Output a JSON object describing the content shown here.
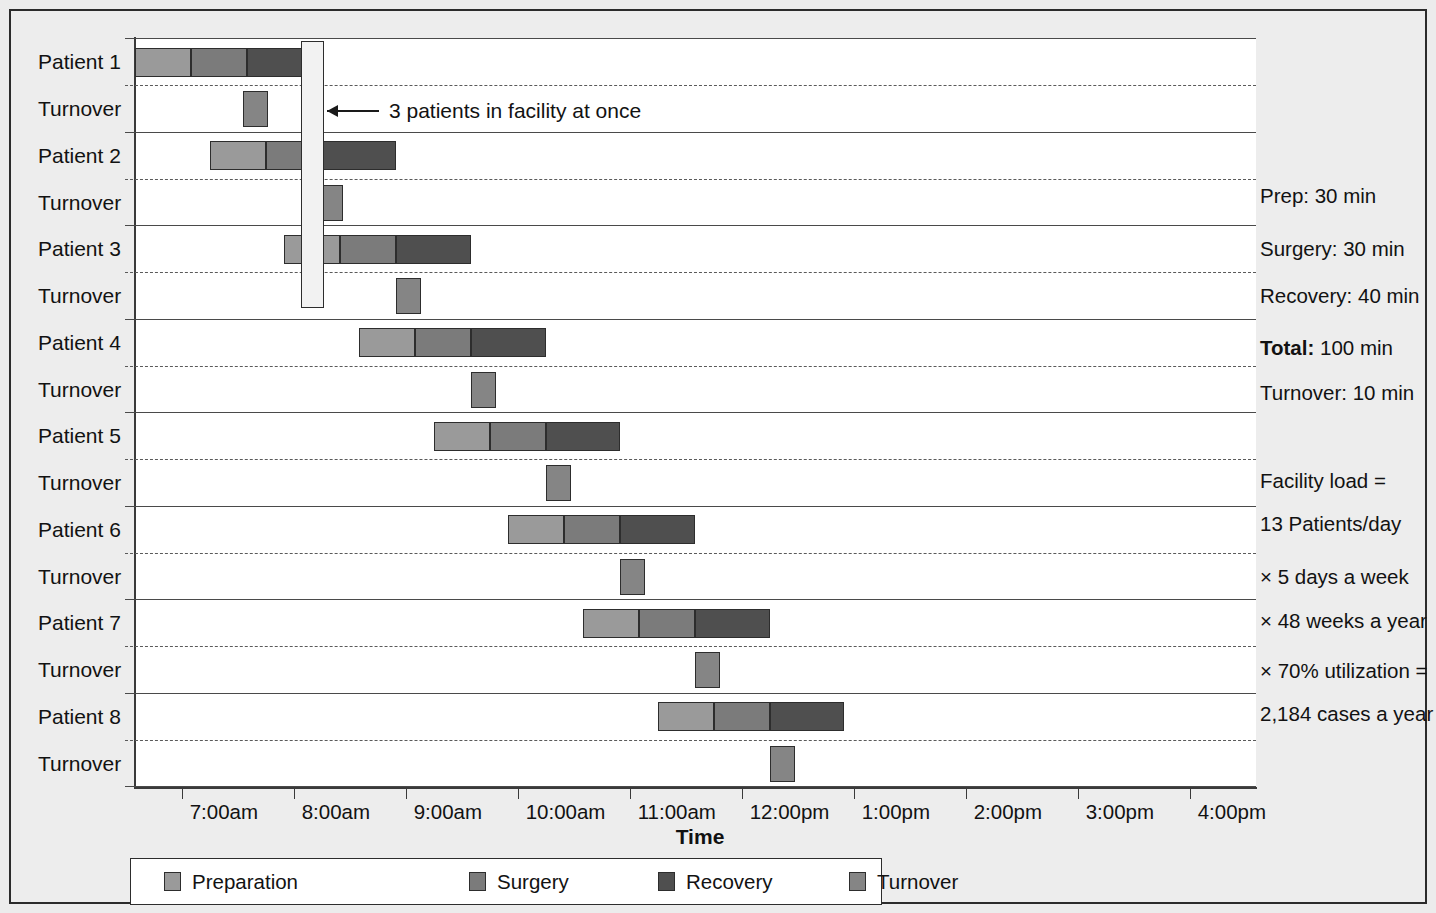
{
  "chart_data": {
    "type": "bar",
    "subtype": "gantt",
    "title": "",
    "xlabel": "Time",
    "ylabel": "",
    "grid": "horizontal row separators (solid between patient groups, dashed between patient and turnover)",
    "legend_position": "bottom",
    "x_axis": {
      "tick_labels": [
        "7:00am",
        "8:00am",
        "9:00am",
        "10:00am",
        "11:00am",
        "12:00pm",
        "1:00pm",
        "2:00pm",
        "3:00pm",
        "4:00pm"
      ],
      "range_start": "6:35am",
      "range_end": "4:35pm",
      "minutes_per_hour_px": 112
    },
    "rows": [
      "Patient 1",
      "Turnover",
      "Patient 2",
      "Turnover",
      "Patient 3",
      "Turnover",
      "Patient 4",
      "Turnover",
      "Patient 5",
      "Turnover",
      "Patient 6",
      "Turnover",
      "Patient 7",
      "Turnover",
      "Patient 8",
      "Turnover"
    ],
    "durations_min": {
      "preparation": 30,
      "surgery": 30,
      "recovery": 40,
      "turnover": 10
    },
    "patients": [
      {
        "name": "Patient 1",
        "start": "6:35am",
        "prep_start_min": 0,
        "segments": [
          {
            "phase": "Preparation",
            "minutes": 30
          },
          {
            "phase": "Surgery",
            "minutes": 30
          },
          {
            "phase": "Recovery",
            "minutes": 40
          }
        ],
        "turnover_start_min": 58
      },
      {
        "name": "Patient 2",
        "start": "7:15am",
        "prep_start_min": 40,
        "segments": [
          {
            "phase": "Preparation",
            "minutes": 30
          },
          {
            "phase": "Surgery",
            "minutes": 30
          },
          {
            "phase": "Recovery",
            "minutes": 40
          }
        ],
        "turnover_start_min": 98
      },
      {
        "name": "Patient 3",
        "start": "7:55am",
        "prep_start_min": 80,
        "segments": [
          {
            "phase": "Preparation",
            "minutes": 30
          },
          {
            "phase": "Surgery",
            "minutes": 30
          },
          {
            "phase": "Recovery",
            "minutes": 40
          }
        ],
        "turnover_start_min": 140
      },
      {
        "name": "Patient 4",
        "start": "8:35am",
        "prep_start_min": 120,
        "segments": [
          {
            "phase": "Preparation",
            "minutes": 30
          },
          {
            "phase": "Surgery",
            "minutes": 30
          },
          {
            "phase": "Recovery",
            "minutes": 40
          }
        ],
        "turnover_start_min": 180
      },
      {
        "name": "Patient 5",
        "start": "9:15am",
        "prep_start_min": 160,
        "segments": [
          {
            "phase": "Preparation",
            "minutes": 30
          },
          {
            "phase": "Surgery",
            "minutes": 30
          },
          {
            "phase": "Recovery",
            "minutes": 40
          }
        ],
        "turnover_start_min": 220
      },
      {
        "name": "Patient 6",
        "start": "9:55am",
        "prep_start_min": 200,
        "segments": [
          {
            "phase": "Preparation",
            "minutes": 30
          },
          {
            "phase": "Surgery",
            "minutes": 30
          },
          {
            "phase": "Recovery",
            "minutes": 40
          }
        ],
        "turnover_start_min": 260
      },
      {
        "name": "Patient 7",
        "start": "10:35am",
        "prep_start_min": 240,
        "segments": [
          {
            "phase": "Preparation",
            "minutes": 30
          },
          {
            "phase": "Surgery",
            "minutes": 30
          },
          {
            "phase": "Recovery",
            "minutes": 40
          }
        ],
        "turnover_start_min": 300
      },
      {
        "name": "Patient 8",
        "start": "11:15am",
        "prep_start_min": 280,
        "segments": [
          {
            "phase": "Preparation",
            "minutes": 30
          },
          {
            "phase": "Surgery",
            "minutes": 30
          },
          {
            "phase": "Recovery",
            "minutes": 40
          }
        ],
        "turnover_start_min": 340
      }
    ],
    "annotation": {
      "text": "3 patients in facility at once",
      "highlight_start_min": 90,
      "highlight_end_min": 100
    },
    "legend": [
      {
        "label": "Preparation",
        "color": "#9a9a9a"
      },
      {
        "label": "Surgery",
        "color": "#7b7b7b"
      },
      {
        "label": "Recovery",
        "color": "#4f4f4f"
      },
      {
        "label": "Turnover",
        "color": "#858585"
      }
    ]
  },
  "side_panel": {
    "lines": [
      {
        "text": "Prep: 30 min",
        "bold_prefix": ""
      },
      {
        "text": "Surgery: 30 min",
        "bold_prefix": ""
      },
      {
        "text": "Recovery: 40 min",
        "bold_prefix": ""
      },
      {
        "text": "100 min",
        "bold_prefix": "Total:"
      },
      {
        "text": "Turnover: 10 min",
        "bold_prefix": ""
      },
      {
        "text": "Facility load =",
        "bold_prefix": ""
      },
      {
        "text": "13 Patients/day",
        "bold_prefix": ""
      },
      {
        "text": "× 5 days a week",
        "bold_prefix": ""
      },
      {
        "text": "× 48 weeks a year",
        "bold_prefix": ""
      },
      {
        "text": "× 70% utilization =",
        "bold_prefix": ""
      },
      {
        "text": "2,184 cases a year",
        "bold_prefix": ""
      }
    ]
  }
}
